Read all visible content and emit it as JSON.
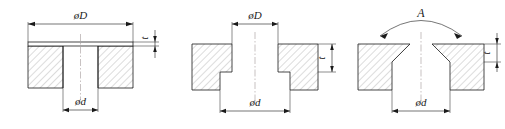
{
  "drawing": {
    "title_visible": false,
    "background_color": "#ffffff",
    "line_color": "#1a1a1a",
    "hatch_color": "#9a9a9a",
    "center_line_color": "#b0a8a8",
    "figure_count": 3
  },
  "figures": [
    {
      "id": "figure-1",
      "type": "spotface-hole",
      "labels": {
        "top_diameter": "øD",
        "bottom_diameter": "ød",
        "depth": "t"
      }
    },
    {
      "id": "figure-2",
      "type": "counterbore-hole",
      "labels": {
        "top_diameter": "øD",
        "bottom_diameter": "ød",
        "depth": "t"
      }
    },
    {
      "id": "figure-3",
      "type": "countersink-hole",
      "labels": {
        "angle": "A",
        "bottom_diameter": "ød",
        "depth": "t"
      }
    }
  ]
}
